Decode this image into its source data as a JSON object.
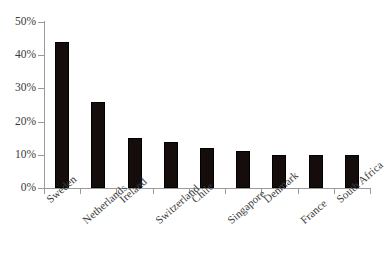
{
  "chart_data": {
    "type": "bar",
    "title": "",
    "subtitle": "",
    "xlabel": "",
    "ylabel": "",
    "categories": [
      "Sweden",
      "Netherlands",
      "Ireland",
      "Switzerland",
      "Chile",
      "Singapore",
      "Denmark",
      "France",
      "South Africa"
    ],
    "values": [
      44,
      26,
      15,
      14,
      12,
      11,
      10,
      10,
      10
    ],
    "value_labels": [
      "44%",
      "26%",
      "15%",
      "14%",
      "12%",
      "11%",
      "10%",
      "10%",
      "10%"
    ],
    "ylim": [
      0,
      50
    ],
    "ytick_values": [
      0,
      10,
      20,
      30,
      40,
      50
    ],
    "ytick_labels": [
      "0%",
      "10%",
      "20%",
      "30%",
      "40%",
      "50%"
    ],
    "grid": false,
    "legend": null,
    "legend_position": "none",
    "bar_color": "#140d0b",
    "axis_color": "#9a9a9a",
    "text_color": "#3a3a3a",
    "background_color": "#ffffff",
    "annotations": []
  }
}
